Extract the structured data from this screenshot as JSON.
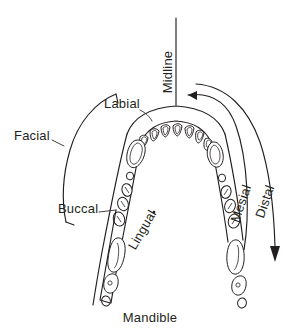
{
  "figure": {
    "background_color": "#ffffff",
    "line_color": "#231f20",
    "width": 299,
    "height": 336
  },
  "labels": {
    "midline": "Midline",
    "labial": "Labial",
    "facial": "Facial",
    "buccal": "Buccal",
    "lingual": "Lingual",
    "mesial": "Mesial",
    "distal": "Distal",
    "mandible": "Mandible"
  },
  "label_details": [
    {
      "name": "midline",
      "text": "Midline",
      "rotation_deg": -90,
      "x": 172,
      "y": 72
    },
    {
      "name": "labial",
      "text": "Labial",
      "rotation_deg": 0,
      "x": 104,
      "y": 108
    },
    {
      "name": "facial",
      "text": "Facial",
      "rotation_deg": 0,
      "x": 14,
      "y": 140
    },
    {
      "name": "buccal",
      "text": "Buccal",
      "rotation_deg": 0,
      "x": 58,
      "y": 213
    },
    {
      "name": "lingual",
      "text": "Lingual",
      "rotation_deg": -60,
      "x": 146,
      "y": 232
    },
    {
      "name": "mesial",
      "text": "Mesial",
      "rotation_deg": -72,
      "x": 245,
      "y": 205
    },
    {
      "name": "distal",
      "text": "Distal",
      "rotation_deg": -72,
      "x": 268,
      "y": 203
    },
    {
      "name": "mandible",
      "text": "Mandible",
      "rotation_deg": 0,
      "x": 150,
      "y": 320
    }
  ],
  "annotations": {
    "lingual_has_trailing_dot": true,
    "midline_is_vertical_line": true,
    "mesial_arrow_points_toward_midline": true,
    "distal_arrow_points_away_downward": true,
    "facial_bracket_spans_labial_to_buccal": true
  },
  "arch": {
    "description": "U-shaped mandibular dental arch, anterior at top, viewed from occlusal",
    "tooth_groups": [
      {
        "group": "incisors",
        "count": 8,
        "shape": "wedge"
      },
      {
        "group": "canines",
        "count": 2,
        "shape": "kidney"
      },
      {
        "group": "premolars",
        "count": 8,
        "shape": "oval"
      },
      {
        "group": "molars",
        "count": 6,
        "shape": "irregular"
      }
    ]
  }
}
